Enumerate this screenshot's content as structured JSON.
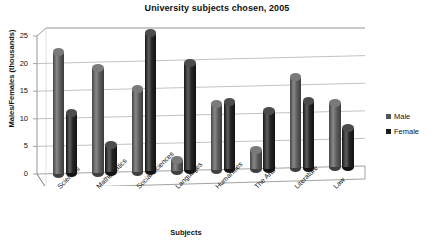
{
  "chart_data": {
    "type": "bar",
    "title": "University subjects chosen, 2005",
    "xlabel": "Subjects",
    "ylabel": "Males/Females (thousands)",
    "ylim": [
      0,
      25
    ],
    "yticks": [
      0,
      5,
      10,
      15,
      20,
      25
    ],
    "grid": true,
    "legend_position": "right",
    "style": "3d-cylinder",
    "categories": [
      "Sciences",
      "Mathematics",
      "Social Sciences",
      "Languages",
      "Humanities",
      "The Arts*",
      "Literature",
      "Law"
    ],
    "series": [
      {
        "name": "Male",
        "color": "#555555",
        "values": [
          22,
          19,
          15,
          2,
          12,
          3.5,
          16.5,
          11.5
        ]
      },
      {
        "name": "Female",
        "color": "#1a1a1a",
        "values": [
          11,
          5,
          25,
          19.5,
          12.2,
          10.5,
          12,
          7
        ]
      }
    ]
  },
  "colors": {
    "background": "#ffffff",
    "axis": "#8a8a8a",
    "grid": "#a8a8a8",
    "text": "#111111",
    "male": "#555555",
    "female": "#1a1a1a"
  }
}
